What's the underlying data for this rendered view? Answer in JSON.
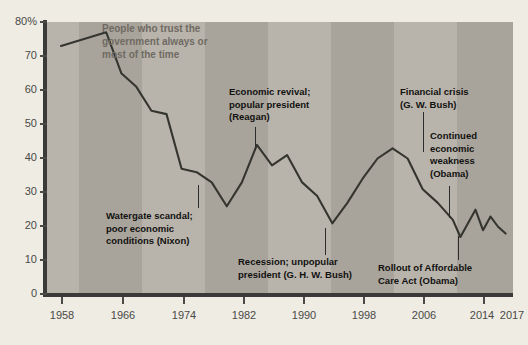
{
  "chart_data": {
    "type": "line",
    "title": "People who trust the government always or most of the time",
    "xlabel": "",
    "ylabel": "",
    "ylim": [
      0,
      80
    ],
    "xlim": [
      1958,
      2017
    ],
    "grid": false,
    "legend": "none",
    "y_ticks": [
      "0",
      "10",
      "20",
      "30",
      "40",
      "50",
      "60",
      "70",
      "80%"
    ],
    "y_tick_values": [
      0,
      10,
      20,
      30,
      40,
      50,
      60,
      70,
      80
    ],
    "x_ticks": [
      "1958",
      "1966",
      "1974",
      "1982",
      "1990",
      "1998",
      "2006",
      "2014",
      "2017"
    ],
    "x_tick_values": [
      1958,
      1966,
      1974,
      1982,
      1990,
      1998,
      2006,
      2014,
      2017
    ],
    "series": [
      {
        "name": "People who trust the government always or most of the time",
        "color": "#35352f",
        "x": [
          1958,
          1964,
          1966,
          1968,
          1970,
          1972,
          1974,
          1976,
          1978,
          1980,
          1982,
          1984,
          1986,
          1988,
          1990,
          1992,
          1994,
          1996,
          1998,
          2000,
          2002,
          2004,
          2006,
          2008,
          2010,
          2011,
          2013,
          2014,
          2015,
          2016,
          2017
        ],
        "y": [
          73,
          77,
          65,
          61,
          54,
          53,
          37,
          36,
          33,
          26,
          33,
          44,
          38,
          41,
          33,
          29,
          21,
          27,
          34,
          40,
          43,
          40,
          31,
          27,
          22,
          17,
          25,
          19,
          23,
          20,
          18
        ]
      }
    ],
    "annotations": [
      {
        "id": "title-note",
        "text": "People who trust the\ngovernment always or\nmost of the time",
        "color": "#6f6a62"
      },
      {
        "id": "watergate",
        "text": "Watergate scandal;\npoor economic\nconditions (Nixon)",
        "points_to_year": 1976,
        "points_to_value": 36
      },
      {
        "id": "reagan",
        "text": "Economic revival;\npopular president\n(Reagan)",
        "points_to_year": 1984,
        "points_to_value": 44
      },
      {
        "id": "ghw-bush",
        "text": "Recession; unpopular\npresident (G. H. W. Bush)",
        "points_to_year": 1994,
        "points_to_value": 21
      },
      {
        "id": "financial-crisis",
        "text": "Financial crisis\n(G. W. Bush)",
        "points_to_year": 2008,
        "points_to_value": 27
      },
      {
        "id": "continued-weakness",
        "text": "Continued\neconomic\nweakness\n(Obama)",
        "points_to_year": 2010,
        "points_to_value": 22
      },
      {
        "id": "aca-rollout",
        "text": "Rollout of Affordable\nCare Act (Obama)",
        "points_to_year": 2011,
        "points_to_value": 17
      }
    ]
  },
  "axis": {
    "y_labels": [
      "80%",
      "70",
      "60",
      "50",
      "40",
      "30",
      "20",
      "10",
      "0"
    ],
    "x_labels": [
      "1958",
      "1966",
      "1974",
      "1982",
      "1990",
      "1998",
      "2006",
      "2014",
      "2017"
    ]
  },
  "annotations": {
    "title_note": "People who trust the\ngovernment always or\nmost of the time",
    "watergate": "Watergate scandal;\npoor economic\nconditions (Nixon)",
    "reagan": "Economic revival;\npopular president\n(Reagan)",
    "ghw_bush": "Recession; unpopular\npresident (G. H. W. Bush)",
    "financial_crisis": "Financial crisis\n(G. W. Bush)",
    "continued_weakness": "Continued\neconomic\nweakness\n(Obama)",
    "aca_rollout": "Rollout of Affordable\nCare Act (Obama)"
  },
  "colors": {
    "background": "#efece4",
    "plot_light_band": "#b9b4ab",
    "plot_dark_band": "#a9a49b",
    "line": "#35352f",
    "axis": "#3a3a38",
    "tick_text": "#4a4a46",
    "annotation_text": "#111110",
    "title_note_text": "#6f6a62"
  }
}
